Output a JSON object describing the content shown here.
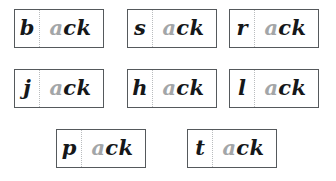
{
  "worksheet": {
    "title": "ack word family cards",
    "rime": "ack",
    "colors": {
      "card_border": "#55595c",
      "divider": "#b9bcbe",
      "onset_text": "#151719",
      "rime_vowel_text": "#a3a6a8",
      "rime_tail_text": "#151719",
      "background": "#ffffff"
    },
    "rows": [
      {
        "row_index": 1,
        "cards": [
          {
            "word": "back",
            "onset": "b",
            "rime_vowel": "a",
            "rime_tail": "ck"
          },
          {
            "word": "sack",
            "onset": "s",
            "rime_vowel": "a",
            "rime_tail": "ck"
          },
          {
            "word": "rack",
            "onset": "r",
            "rime_vowel": "a",
            "rime_tail": "ck"
          }
        ]
      },
      {
        "row_index": 2,
        "cards": [
          {
            "word": "jack",
            "onset": "j",
            "rime_vowel": "a",
            "rime_tail": "ck"
          },
          {
            "word": "hack",
            "onset": "h",
            "rime_vowel": "a",
            "rime_tail": "ck"
          },
          {
            "word": "lack",
            "onset": "l",
            "rime_vowel": "a",
            "rime_tail": "ck"
          }
        ]
      },
      {
        "row_index": 3,
        "cards": [
          {
            "word": "pack",
            "onset": "p",
            "rime_vowel": "a",
            "rime_tail": "ck"
          },
          {
            "word": "tack",
            "onset": "t",
            "rime_vowel": "a",
            "rime_tail": "ck"
          }
        ]
      }
    ]
  }
}
